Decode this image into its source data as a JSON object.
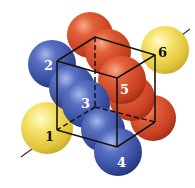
{
  "figure": {
    "colors": {
      "yellow": "#f2d84a",
      "blue": "#3f55a8",
      "red": "#d9482a",
      "edge": "#141414"
    },
    "labels": {
      "l1": "1",
      "l2": "2",
      "l3": "3",
      "l4": "4",
      "l5": "5",
      "l6": "6"
    },
    "spheres": [
      {
        "id": "sphere-1",
        "color": "yellow",
        "label": "1"
      },
      {
        "id": "sphere-2",
        "color": "blue",
        "label": "2"
      },
      {
        "id": "sphere-3",
        "color": "blue",
        "label": "3"
      },
      {
        "id": "sphere-4",
        "color": "blue",
        "label": "4"
      },
      {
        "id": "sphere-5",
        "color": "red",
        "label": "5"
      },
      {
        "id": "sphere-6",
        "color": "yellow",
        "label": "6"
      }
    ],
    "axis": "body-diagonal line through vertices of spheres 1 and 6"
  }
}
